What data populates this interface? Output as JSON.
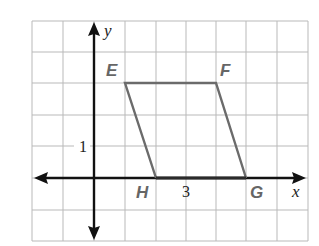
{
  "diagram": {
    "type": "coordinate-grid-parallelogram",
    "axes": {
      "x_label": "x",
      "y_label": "y"
    },
    "tick_labels": {
      "y_unit": "1",
      "segment_length": "3"
    },
    "vertices": [
      {
        "name": "E",
        "label": "E",
        "x": 1,
        "y": 3
      },
      {
        "name": "F",
        "label": "F",
        "x": 4,
        "y": 3
      },
      {
        "name": "G",
        "label": "G",
        "x": 5,
        "y": 0
      },
      {
        "name": "H",
        "label": "H",
        "x": 2,
        "y": 0
      }
    ],
    "grid": {
      "x_min": -2,
      "x_max": 7,
      "y_min": -2,
      "y_max": 5
    },
    "colors": {
      "grid": "#b9b9b9",
      "axis": "#111111",
      "shape": "#6b6b6b",
      "label": "#666666"
    }
  }
}
